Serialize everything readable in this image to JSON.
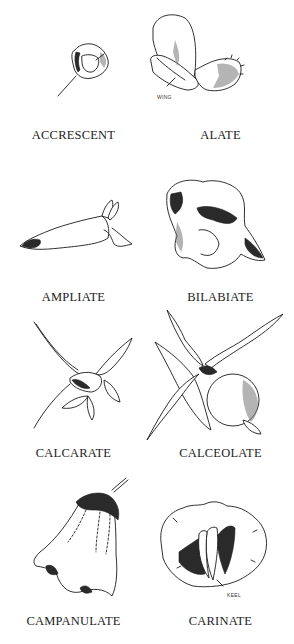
{
  "figure": {
    "terms": [
      {
        "id": "accrescent",
        "label": "ACCRESCENT",
        "callout": null
      },
      {
        "id": "alate",
        "label": "ALATE",
        "callout": "WING"
      },
      {
        "id": "ampliate",
        "label": "AMPLIATE",
        "callout": null
      },
      {
        "id": "bilabiate",
        "label": "BILABIATE",
        "callout": null
      },
      {
        "id": "calcarate",
        "label": "CALCARATE",
        "callout": null
      },
      {
        "id": "calceolate",
        "label": "CALCEOLATE",
        "callout": null
      },
      {
        "id": "campanulate",
        "label": "CAMPANULATE",
        "callout": null
      },
      {
        "id": "carinate",
        "label": "CARINATE",
        "callout": "KEEL"
      }
    ]
  }
}
